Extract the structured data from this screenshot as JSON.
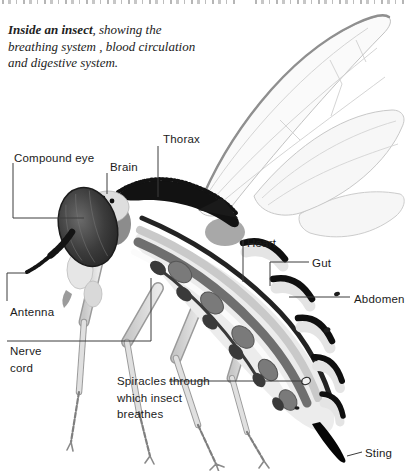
{
  "caption": {
    "bold_lead": "Inside an insect",
    "line1_rest": ", showing the",
    "line2": "breathing system , blood circulation",
    "line3": "and digestive system."
  },
  "labels": {
    "compound_eye": "Compound eye",
    "brain": "Brain",
    "thorax": "Thorax",
    "heart": "Heart",
    "gut": "Gut",
    "abdomen": "Abdomen",
    "antenna": "Antenna",
    "nerve_cord": "Nerve cord",
    "spiracles": "Spiracles through which insect breathes",
    "sting": "Sting"
  },
  "colors": {
    "background": "#ffffff",
    "label_text": "#1b1b1b",
    "leader_line": "#3c3c3c",
    "ink_black": "#121212",
    "body_light": "#ececec",
    "band_mid_gray": "#6f6f6f",
    "band_light_gray": "#c9c9c9",
    "wing_outline": "#c2c2c2"
  }
}
